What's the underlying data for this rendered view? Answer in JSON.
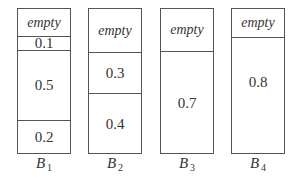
{
  "diagram": {
    "type": "bin-packing",
    "bins": [
      {
        "name": "B",
        "index": "1",
        "segments": [
          {
            "label": "empty",
            "empty": true,
            "top": 0,
            "height": 27
          },
          {
            "label": "0.1",
            "empty": false,
            "top": 27,
            "height": 14
          },
          {
            "label": "0.5",
            "empty": false,
            "top": 41,
            "height": 70
          },
          {
            "label": "0.2",
            "empty": false,
            "top": 111,
            "height": 34
          }
        ]
      },
      {
        "name": "B",
        "index": "2",
        "segments": [
          {
            "label": "empty",
            "empty": true,
            "top": 0,
            "height": 43
          },
          {
            "label": "0.3",
            "empty": false,
            "top": 43,
            "height": 41
          },
          {
            "label": "0.4",
            "empty": false,
            "top": 84,
            "height": 61
          }
        ]
      },
      {
        "name": "B",
        "index": "3",
        "segments": [
          {
            "label": "empty",
            "empty": true,
            "top": 0,
            "height": 42
          },
          {
            "label": "0.7",
            "empty": false,
            "top": 42,
            "height": 103
          }
        ]
      },
      {
        "name": "B",
        "index": "4",
        "segments": [
          {
            "label": "empty",
            "empty": true,
            "top": 0,
            "height": 28
          },
          {
            "label": "0.8",
            "empty": false,
            "top": 28,
            "height": 117
          }
        ]
      }
    ]
  }
}
